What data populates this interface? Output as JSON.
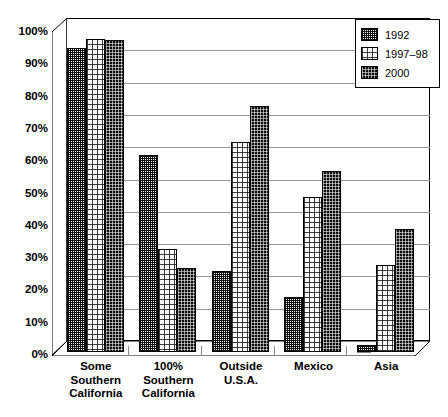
{
  "chart_data": {
    "type": "bar",
    "title": "",
    "subtitle": "",
    "xlabel": "",
    "ylabel": "",
    "ylim": [
      0,
      100
    ],
    "grid": true,
    "legend_position": "top-right",
    "categories": [
      "Some Southern California",
      "100% Southern California",
      "Outside U.S.A.",
      "Mexico",
      "Asia"
    ],
    "category_lines": [
      [
        "Some",
        "Southern",
        "California"
      ],
      [
        "100%",
        "Southern",
        "California"
      ],
      [
        "Outside",
        "U.S.A."
      ],
      [
        "Mexico"
      ],
      [
        "Asia"
      ]
    ],
    "series": [
      {
        "name": "1992",
        "pattern": "checker-medium",
        "values": [
          94,
          61,
          25,
          17,
          2
        ]
      },
      {
        "name": "1997–98",
        "pattern": "dots-light",
        "values": [
          97,
          32,
          65,
          48,
          27
        ]
      },
      {
        "name": "2000",
        "pattern": "dots-dark",
        "values": [
          96.5,
          26,
          76,
          56,
          38
        ]
      }
    ],
    "yticks": [
      "0%",
      "10%",
      "20%",
      "30%",
      "40%",
      "50%",
      "60%",
      "70%",
      "80%",
      "90%",
      "100%"
    ],
    "ytick_values": [
      0,
      10,
      20,
      30,
      40,
      50,
      60,
      70,
      80,
      90,
      100
    ]
  },
  "legend": {
    "entries": [
      {
        "label": "1992"
      },
      {
        "label": "1997–98"
      },
      {
        "label": "2000"
      }
    ]
  }
}
